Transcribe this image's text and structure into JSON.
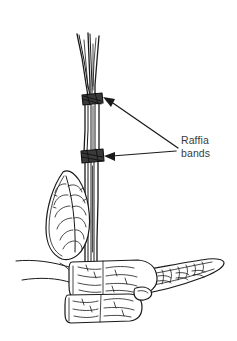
{
  "figure": {
    "kind": "line-drawing",
    "background_color": "#ffffff",
    "ink_color": "#1a1a1a",
    "width": 237,
    "height": 341
  },
  "annotations": {
    "label": {
      "line1": "Raffia",
      "line2": "bands",
      "color": "#3b3b3b",
      "x": 181,
      "y": 136
    },
    "leaders": [
      {
        "name": "upper-leader",
        "from_x": 178,
        "from_y": 148,
        "to_x": 104,
        "to_y": 99
      },
      {
        "name": "lower-leader",
        "from_x": 176,
        "from_y": 151,
        "to_x": 106,
        "to_y": 156
      }
    ]
  },
  "parts": {
    "stem_bundle": {
      "name": "stem-bundle",
      "cane_count": 5,
      "top_y": 33,
      "base_y": 262
    },
    "bands": [
      {
        "name": "upper-raffia-band",
        "cx": 92,
        "cy": 99,
        "width": 20,
        "height": 10,
        "color": "#3a3a3a"
      },
      {
        "name": "lower-raffia-band",
        "cx": 92,
        "cy": 156,
        "width": 21,
        "height": 11,
        "color": "#3a3a3a"
      }
    ],
    "leaves": [
      {
        "name": "upright-left-leaf",
        "venation": "pinnate"
      },
      {
        "name": "cut-center-leaf",
        "venation": "pinnate-cut"
      },
      {
        "name": "cut-lower-leaf",
        "venation": "pinnate-cut"
      },
      {
        "name": "right-blade-leaf",
        "venation": "mottled"
      }
    ],
    "ground_lines": {
      "name": "ground-lines",
      "count": 2
    }
  }
}
